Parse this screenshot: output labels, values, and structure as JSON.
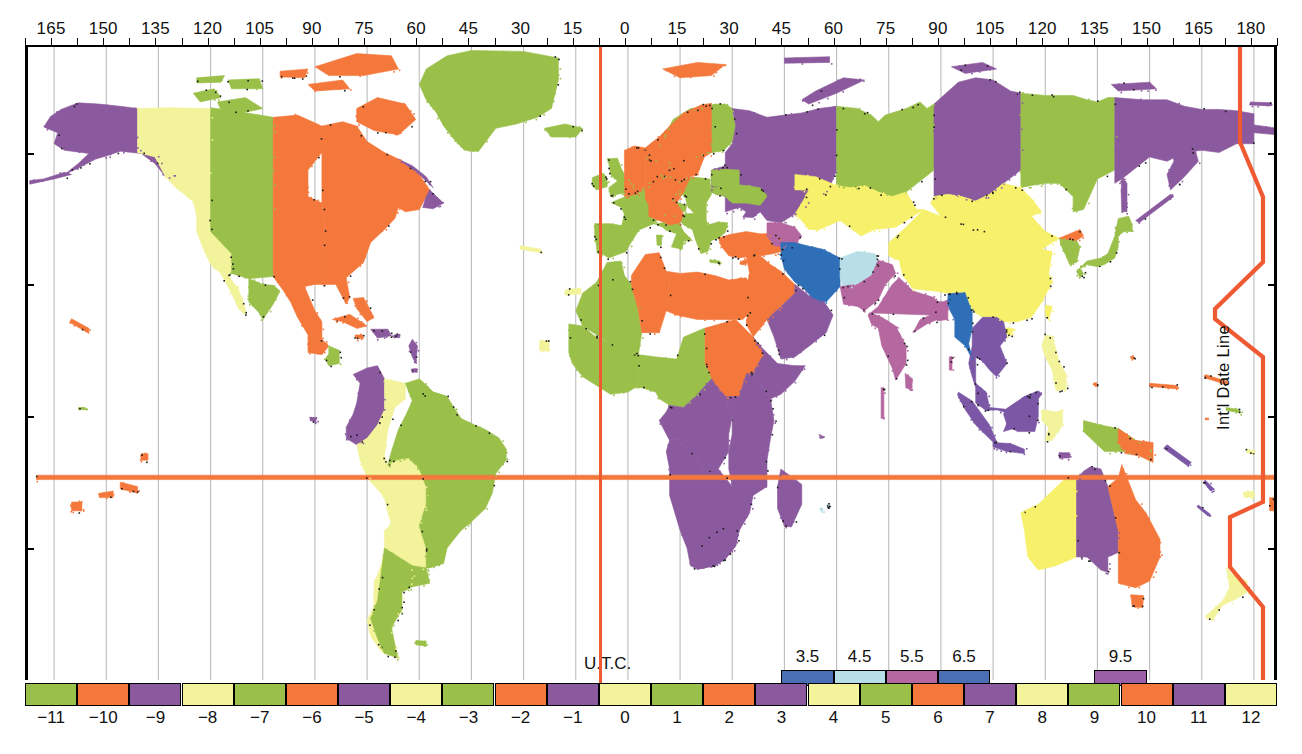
{
  "figure": {
    "kind": "world-time-zone-map",
    "utc_label": "U.T.C.",
    "date_line_label": "Int'l Date Line",
    "accent_red": "#f05a32"
  },
  "axis_top": {
    "title": "Longitude (degrees)",
    "labels": [
      "165",
      "150",
      "135",
      "120",
      "105",
      "90",
      "75",
      "60",
      "45",
      "30",
      "15",
      "0",
      "15",
      "30",
      "45",
      "60",
      "75",
      "90",
      "105",
      "120",
      "135",
      "150",
      "165",
      "180"
    ],
    "values": [
      -165,
      -150,
      -135,
      -120,
      -105,
      -90,
      -75,
      -60,
      -45,
      -30,
      -15,
      0,
      15,
      30,
      45,
      60,
      75,
      90,
      105,
      120,
      135,
      150,
      165,
      180
    ],
    "minor_step": 7.5,
    "range": [
      -172.5,
      187.5
    ]
  },
  "legend": {
    "labels": [
      "−11",
      "−10",
      "−9",
      "−8",
      "−7",
      "−6",
      "−5",
      "−4",
      "−3",
      "−2",
      "−1",
      "0",
      "1",
      "2",
      "3",
      "4",
      "5",
      "6",
      "7",
      "8",
      "9",
      "10",
      "11",
      "12"
    ],
    "offsets": [
      -11,
      -10,
      -9,
      -8,
      -7,
      -6,
      -5,
      -4,
      -3,
      -2,
      -1,
      0,
      1,
      2,
      3,
      4,
      5,
      6,
      7,
      8,
      9,
      10,
      11,
      12
    ],
    "colors": [
      "#9ac04a",
      "#f4783c",
      "#8b5a9e",
      "#f2f39a",
      "#9ac04a",
      "#f4783c",
      "#8b5a9e",
      "#f2f39a",
      "#9ac04a",
      "#f4783c",
      "#8b5a9e",
      "#f2f39a",
      "#9ac04a",
      "#f4783c",
      "#8b5a9e",
      "#f2f39a",
      "#9ac04a",
      "#f4783c",
      "#8b5a9e",
      "#f2f39a",
      "#9ac04a",
      "#f4783c",
      "#8b5a9e",
      "#f2f39a"
    ]
  },
  "half_hour_zones": [
    {
      "label": "3.5",
      "offset": 3.5,
      "color": "#4a6fb5"
    },
    {
      "label": "4.5",
      "offset": 4.5,
      "color": "#b8dfe8"
    },
    {
      "label": "5.5",
      "offset": 5.5,
      "color": "#b5679f"
    },
    {
      "label": "6.5",
      "offset": 6.5,
      "color": "#4a6fb5"
    },
    {
      "label": "9.5",
      "offset": 9.5,
      "color": "#9b5fa8"
    }
  ],
  "palette": {
    "green": "#9ac04a",
    "orange": "#f4783c",
    "purple": "#8b5a9e",
    "yellow": "#f2f39a",
    "yellow_strong": "#f6f06a",
    "blue": "#2f6fb8",
    "lightblue": "#b8dfe8",
    "mauve": "#b5679f",
    "violet": "#7b57a6",
    "ocean": "#ffffff",
    "graticule": "#b9b9b9",
    "frame": "#000000"
  },
  "map_notes": {
    "projection": "equirectangular",
    "lon_range": [
      -172.5,
      187.5
    ],
    "lat_range": [
      -60,
      84
    ],
    "graticule_step_deg": 15
  }
}
